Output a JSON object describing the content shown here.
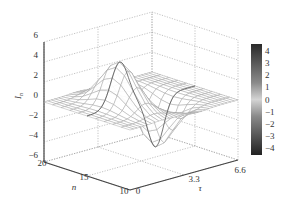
{
  "chart_data": {
    "type": "surface3d",
    "title": "",
    "xlabel": "τ",
    "ylabel": "n",
    "zlabel": "I_n",
    "x_ticks": [
      "0",
      "3.3",
      "6.6"
    ],
    "y_ticks": [
      "20",
      "15",
      "10"
    ],
    "z_ticks": [
      "6",
      "4",
      "2",
      "0",
      "−2",
      "−4",
      "−6"
    ],
    "xlim": [
      0,
      6.6
    ],
    "ylim": [
      10,
      20
    ],
    "zlim": [
      -6,
      6
    ],
    "grid": true,
    "surface": {
      "description": "Wave packet along τ centered near n≈15: positive peak ≈ +4.5 around τ≈2, negative trough ≈ −5 around τ≈4, near zero elsewhere",
      "peak": {
        "tau": 2.0,
        "n": 15,
        "value": 4.5
      },
      "trough": {
        "tau": 4.2,
        "n": 15,
        "value": -5.0
      }
    },
    "colorbar": {
      "placement": "right",
      "tick_labels": [
        "4",
        "3",
        "2",
        "1",
        "0",
        "−1",
        "−2",
        "−3",
        "−4"
      ],
      "range": [
        -4.6,
        4.6
      ],
      "colormap": "gray"
    }
  }
}
